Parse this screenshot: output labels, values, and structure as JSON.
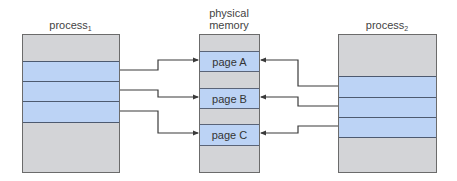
{
  "diagram": {
    "type": "shared-memory-mapping",
    "process1": {
      "label": "process",
      "subscript": "1",
      "regions": 3
    },
    "physical_memory": {
      "label_line1": "physical",
      "label_line2": "memory",
      "pages": [
        {
          "label": "page A"
        },
        {
          "label": "page B"
        },
        {
          "label": "page C"
        }
      ]
    },
    "process2": {
      "label": "process",
      "subscript": "2",
      "regions": 3
    },
    "mappings": [
      {
        "from": "process1.region1",
        "to": "page A"
      },
      {
        "from": "process1.region2",
        "to": "page B"
      },
      {
        "from": "process1.region3",
        "to": "page C"
      },
      {
        "from": "process2.region1",
        "to": "page A"
      },
      {
        "from": "process2.region2",
        "to": "page B"
      },
      {
        "from": "process2.region3",
        "to": "page C"
      }
    ],
    "colors": {
      "unused_memory": "#d3d4d7",
      "mapped_region": "#bcd3f5",
      "border": "#4d5a70",
      "arrow": "#3a3a3a"
    }
  }
}
